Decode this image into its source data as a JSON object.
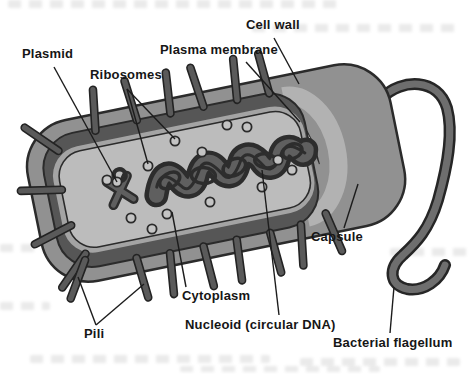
{
  "figure_labels": [
    {
      "id": "plasmid",
      "text": "Plasmid",
      "x": 22,
      "y": 47,
      "leaders": [
        [
          54,
          67,
          117,
          182
        ]
      ]
    },
    {
      "id": "ribosomes",
      "text": "Ribosomes",
      "x": 90,
      "y": 68,
      "leaders": [
        [
          127,
          89,
          148,
          164
        ],
        [
          127,
          89,
          175,
          139
        ]
      ]
    },
    {
      "id": "plasma-membrane",
      "text": "Plasma membrane",
      "x": 160,
      "y": 43,
      "leaders": [
        [
          246,
          62,
          300,
          122
        ]
      ]
    },
    {
      "id": "cell-wall",
      "text": "Cell wall",
      "x": 246,
      "y": 18,
      "leaders": [
        [
          274,
          38,
          299,
          84
        ]
      ]
    },
    {
      "id": "capsule",
      "text": "Capsule",
      "x": 311,
      "y": 230,
      "leaders": [
        [
          344,
          228,
          358,
          184
        ]
      ]
    },
    {
      "id": "cytoplasm",
      "text": "Cytoplasm",
      "x": 182,
      "y": 289,
      "leaders": [
        [
          186,
          287,
          172,
          212
        ]
      ]
    },
    {
      "id": "nucleoid",
      "text": "Nucleoid (circular DNA)",
      "x": 185,
      "y": 318,
      "leaders": [
        [
          279,
          315,
          262,
          170
        ]
      ]
    },
    {
      "id": "pili",
      "text": "Pili",
      "x": 84,
      "y": 327,
      "leaders": [
        [
          96,
          325,
          78,
          277
        ],
        [
          96,
          325,
          144,
          284
        ]
      ]
    },
    {
      "id": "bacterial-flagellum",
      "text": "Bacterial flagellum",
      "x": 333,
      "y": 336,
      "leaders": [
        [
          390,
          333,
          394,
          287
        ]
      ]
    }
  ],
  "organelles": {
    "ribosome_positions": [
      [
        107,
        180
      ],
      [
        117,
        182
      ],
      [
        131,
        218
      ],
      [
        152,
        229
      ],
      [
        148,
        166
      ],
      [
        175,
        141
      ],
      [
        202,
        152
      ],
      [
        210,
        202
      ],
      [
        227,
        125
      ],
      [
        247,
        127
      ],
      [
        262,
        187
      ],
      [
        278,
        160
      ],
      [
        292,
        170
      ],
      [
        167,
        214
      ]
    ]
  },
  "colors": {
    "background": "#ffffff",
    "capsule": "#919191",
    "cell_wall": "#565656",
    "plasma_membrane": "#a4a4a4",
    "membrane_gap": "#b2b2b2",
    "membrane_highlight": "#fcfcfc",
    "cytoplasm": "#bcbcbc",
    "nucleoid_body": "#5f5f5f",
    "nucleoid_outline": "#2d2d2d",
    "organelle_dark": "#5a5a5a",
    "flagellum": "#6e6e6e",
    "outline": "#2b2b2b",
    "ribosome_fill": "#c4c4c4",
    "label_text": "#161616",
    "leader_line": "#1c1c1c"
  }
}
